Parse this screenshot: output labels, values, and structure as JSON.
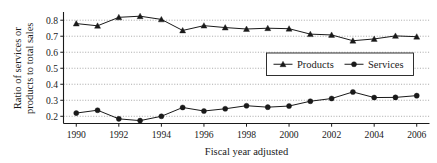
{
  "chart_data": {
    "type": "line",
    "title": "",
    "xlabel": "Fiscal year adjusted",
    "ylabel": "Ratio of services or products to total sales",
    "ylabel_line1": "Ratio of services or",
    "ylabel_line2": "products to total sales",
    "x": [
      1990,
      1991,
      1992,
      1993,
      1994,
      1995,
      1996,
      1997,
      1998,
      1999,
      2000,
      2001,
      2002,
      2003,
      2004,
      2005,
      2006
    ],
    "categories": [
      "1990",
      "1991",
      "1992",
      "1993",
      "1994",
      "1995",
      "1996",
      "1997",
      "1998",
      "1999",
      "2000",
      "2001",
      "2002",
      "2003",
      "2004",
      "2005",
      "2006"
    ],
    "xtick_labels": [
      "1990",
      "1992",
      "1994",
      "1996",
      "1998",
      "2000",
      "2002",
      "2004",
      "2006"
    ],
    "xtick_values": [
      1990,
      1992,
      1994,
      1996,
      1998,
      2000,
      2002,
      2004,
      2006
    ],
    "ytick_labels": [
      "0.2",
      "0.3",
      "0.4",
      "0.5",
      "0.6",
      "0.7",
      "0.8"
    ],
    "ytick_values": [
      0.2,
      0.3,
      0.4,
      0.5,
      0.6,
      0.7,
      0.8
    ],
    "xlim": [
      1989.4,
      2006.6
    ],
    "ylim": [
      0.155,
      0.845
    ],
    "grid": true,
    "legend_position": "center-right",
    "series": [
      {
        "name": "Products",
        "marker": "triangle",
        "color": "#1a1a1a",
        "values": [
          0.779,
          0.765,
          0.818,
          0.825,
          0.805,
          0.736,
          0.766,
          0.754,
          0.745,
          0.75,
          0.747,
          0.713,
          0.708,
          0.672,
          0.683,
          0.702,
          0.697
        ]
      },
      {
        "name": "Services",
        "marker": "circle",
        "color": "#1a1a1a",
        "values": [
          0.22,
          0.238,
          0.184,
          0.173,
          0.2,
          0.255,
          0.233,
          0.247,
          0.266,
          0.257,
          0.264,
          0.294,
          0.311,
          0.352,
          0.317,
          0.318,
          0.329
        ]
      }
    ]
  },
  "legend": {
    "items": [
      {
        "label": "Products",
        "marker": "triangle"
      },
      {
        "label": "Services",
        "marker": "circle"
      }
    ]
  },
  "colors": {
    "ink": "#1a1a1a",
    "grid": "#8d8d8d",
    "background": "#ffffff"
  }
}
